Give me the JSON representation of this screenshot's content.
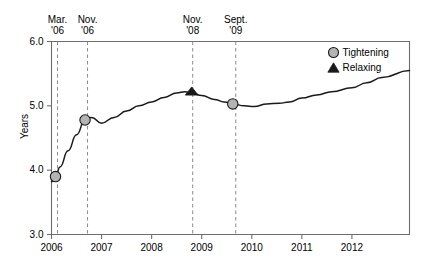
{
  "chart_data": {
    "type": "line",
    "title": "",
    "subtitle": "",
    "xlabel": "",
    "ylabel": "Years",
    "xlim": [
      2006.0,
      2013.15
    ],
    "ylim": [
      3.0,
      6.0
    ],
    "grid": false,
    "yticks": [
      "3.0",
      "4.0",
      "5.0",
      "6.0"
    ],
    "ytick_values": [
      3.0,
      4.0,
      5.0,
      6.0
    ],
    "xticks": [
      "2006",
      "2007",
      "2008",
      "2009",
      "2010",
      "2011",
      "2012"
    ],
    "xtick_values": [
      2006,
      2007,
      2008,
      2009,
      2010,
      2011,
      2012
    ],
    "series": [
      {
        "name": "Average maturity",
        "color": "#1a1a1a",
        "x": [
          2006.0,
          2006.08,
          2006.17,
          2006.33,
          2006.5,
          2006.67,
          2006.8,
          2007.0,
          2007.25,
          2007.5,
          2007.75,
          2008.0,
          2008.25,
          2008.5,
          2008.67,
          2008.8,
          2009.0,
          2009.25,
          2009.45,
          2009.62,
          2009.85,
          2010.05,
          2010.3,
          2010.55,
          2010.75,
          2011.0,
          2011.3,
          2011.6,
          2012.0,
          2012.3,
          2012.6,
          2013.15
        ],
        "y": [
          3.82,
          3.9,
          4.05,
          4.3,
          4.55,
          4.78,
          4.82,
          4.73,
          4.82,
          4.92,
          5.0,
          5.06,
          5.13,
          5.2,
          5.22,
          5.2,
          5.16,
          5.1,
          5.06,
          5.03,
          5.0,
          4.99,
          5.03,
          5.04,
          5.06,
          5.12,
          5.17,
          5.22,
          5.28,
          5.36,
          5.44,
          5.55
        ]
      }
    ],
    "markers": [
      {
        "label": "Tightening",
        "shape": "circle",
        "x": 2006.08,
        "y": 3.9,
        "fill": "#b3b3b3",
        "stroke": "#1a1a1a"
      },
      {
        "label": "Tightening",
        "shape": "circle",
        "x": 2006.67,
        "y": 4.78,
        "fill": "#b3b3b3",
        "stroke": "#1a1a1a"
      },
      {
        "label": "Relaxing",
        "shape": "triangle",
        "x": 2008.8,
        "y": 5.21,
        "fill": "#1a1a1a",
        "stroke": "#1a1a1a"
      },
      {
        "label": "Tightening",
        "shape": "circle",
        "x": 2009.62,
        "y": 5.03,
        "fill": "#b3b3b3",
        "stroke": "#1a1a1a"
      }
    ],
    "annotations": [
      {
        "line1": "Mar.",
        "line2": "'06",
        "x": 2006.12
      },
      {
        "line1": "Nov.",
        "line2": "'06",
        "x": 2006.72
      },
      {
        "line1": "Nov.",
        "line2": "'08",
        "x": 2008.82
      },
      {
        "line1": "Sept.",
        "line2": "'09",
        "x": 2009.68
      }
    ],
    "legend": {
      "position": "top-right",
      "entries": [
        {
          "label": "Tightening",
          "shape": "circle",
          "fill": "#b3b3b3",
          "stroke": "#1a1a1a"
        },
        {
          "label": "Relaxing",
          "shape": "triangle",
          "fill": "#1a1a1a",
          "stroke": "#1a1a1a"
        }
      ]
    },
    "colors": {
      "line": "#1a1a1a",
      "axis": "#6e6e6e",
      "dashed_guides": "#8a8a8a",
      "marker_fill": "#b3b3b3",
      "background": "#ffffff"
    }
  }
}
